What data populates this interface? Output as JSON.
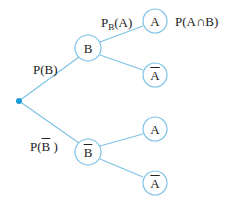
{
  "diagram": {
    "type": "probability-tree",
    "colors": {
      "line": "#7ec3e6",
      "root_dot": "#1a9ad9",
      "text": "#222222"
    },
    "root": {
      "x": 19,
      "y": 101
    },
    "nodes": [
      {
        "id": "B",
        "label": "B",
        "overline": false,
        "x": 88,
        "y": 48
      },
      {
        "id": "Bbar",
        "label": "B",
        "overline": true,
        "x": 88,
        "y": 152
      },
      {
        "id": "A1",
        "label": "A",
        "overline": false,
        "x": 155,
        "y": 21
      },
      {
        "id": "Abar1",
        "label": "A",
        "overline": true,
        "x": 155,
        "y": 75
      },
      {
        "id": "A2",
        "label": "A",
        "overline": false,
        "x": 155,
        "y": 129
      },
      {
        "id": "Abar2",
        "label": "A",
        "overline": true,
        "x": 155,
        "y": 183
      }
    ],
    "branch_labels": {
      "p_b": "P(B)",
      "p_bbar_prefix": "P(",
      "p_bbar_var": "B",
      "p_bbar_suffix": " )",
      "pb_a_main": "P",
      "pb_a_sub": "B",
      "pb_a_arg": "(A)",
      "p_a_and_b": "P(A∩B)"
    }
  }
}
